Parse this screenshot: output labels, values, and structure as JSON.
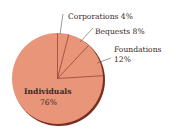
{
  "chart_data": {
    "type": "pie",
    "title": "",
    "slices": [
      {
        "label": "Corporations",
        "value": 4,
        "display": "Corporations 4%"
      },
      {
        "label": "Bequests",
        "value": 8,
        "display": "Bequests 8%"
      },
      {
        "label": "Foundations",
        "value": 12,
        "display": "Foundations",
        "display2": "12%"
      },
      {
        "label": "Individuals",
        "value": 76,
        "display": "Individuals",
        "display2": "76%"
      }
    ],
    "start_angle": "12 o'clock, clockwise",
    "legend": "none (direct labels)",
    "colors": {
      "fill": "#E8957A",
      "edge": "#7A2E22",
      "lines": "#8A3A2C"
    }
  }
}
